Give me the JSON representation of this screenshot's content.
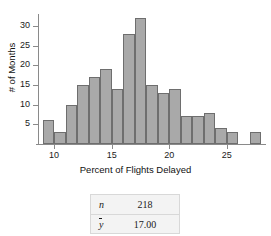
{
  "chart_data": {
    "type": "bar",
    "title": "",
    "subtitle": "",
    "xlabel": "Percent of Flights Delayed",
    "ylabel": "# of Months",
    "xlim": [
      8.6,
      28.4
    ],
    "ylim": [
      0,
      33
    ],
    "grid": false,
    "legend": null,
    "bin_width": 1,
    "bin_starts": [
      9,
      10,
      11,
      12,
      13,
      14,
      15,
      16,
      17,
      18,
      19,
      20,
      21,
      22,
      23,
      24,
      25,
      26,
      27
    ],
    "categories": [
      "9-10",
      "10-11",
      "11-12",
      "12-13",
      "13-14",
      "14-15",
      "15-16",
      "16-17",
      "17-18",
      "18-19",
      "19-20",
      "20-21",
      "21-22",
      "22-23",
      "23-24",
      "24-25",
      "25-26",
      "26-27",
      "27-28"
    ],
    "values": [
      6,
      3,
      10,
      15,
      17,
      19,
      14,
      28,
      32,
      15,
      13,
      14,
      7,
      7,
      8,
      4,
      3,
      0,
      3
    ],
    "x_ticks": [
      10,
      15,
      20,
      25
    ],
    "x_tick_labels": [
      "10",
      "15",
      "20",
      "25"
    ],
    "y_ticks": [
      5,
      10,
      15,
      20,
      25,
      30
    ],
    "y_tick_labels": [
      "5",
      "10",
      "15",
      "20",
      "25",
      "30"
    ],
    "bar_fill_color": "#a9a9a9",
    "bar_edge_color": "#6e6e6e",
    "axis_color": "#8a8a8a"
  },
  "stats_table": {
    "rows": [
      {
        "symbol": "n",
        "value": "218"
      },
      {
        "symbol": "y",
        "value": "17.00"
      }
    ]
  }
}
